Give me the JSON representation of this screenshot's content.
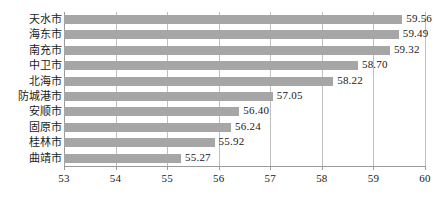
{
  "chart_data": {
    "type": "bar",
    "orientation": "horizontal",
    "title": "",
    "subtitle": "",
    "xlabel": "",
    "ylabel": "",
    "categories": [
      "天水市",
      "海东市",
      "南充市",
      "中卫市",
      "北海市",
      "防城港市",
      "安顺市",
      "固原市",
      "桂林市",
      "曲靖市"
    ],
    "values": [
      59.56,
      59.49,
      59.32,
      58.7,
      58.22,
      57.05,
      56.4,
      56.24,
      55.92,
      55.27
    ],
    "value_labels": [
      "59.56",
      "59.49",
      "59.32",
      "58.70",
      "58.22",
      "57.05",
      "56.40",
      "56.24",
      "55.92",
      "55.27"
    ],
    "xlim": [
      53,
      60
    ],
    "xticks": [
      53,
      54,
      55,
      56,
      57,
      58,
      59,
      60
    ],
    "xtick_labels": [
      "53",
      "54",
      "55",
      "56",
      "57",
      "58",
      "59",
      "60"
    ],
    "grid": true,
    "grid_axis": "x",
    "legend": false,
    "legend_position": "none",
    "bar_color": "#a6a6a6",
    "grid_color": "#bfbfbf",
    "axis_color": "#9a9a9a",
    "background_color": "#ffffff",
    "text_color": "#202020"
  }
}
